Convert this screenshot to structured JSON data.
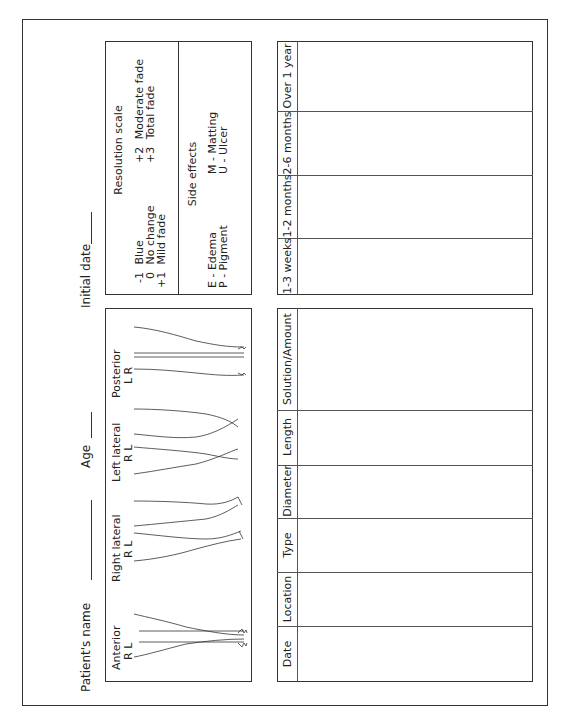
{
  "header": {
    "patient_name_label": "Patient's name",
    "age_label": "Age",
    "initial_date_label": "Initial date"
  },
  "resolution_scale": {
    "title": "Resolution scale",
    "items": [
      {
        "code": "-1",
        "label": "Blue"
      },
      {
        "code": "0",
        "label": "No change"
      },
      {
        "code": "+1",
        "label": "Mild fade"
      },
      {
        "code": "+2",
        "label": "Moderate fade"
      },
      {
        "code": "+3",
        "label": "Total fade"
      }
    ]
  },
  "side_effects": {
    "title": "Side effects",
    "items": [
      {
        "code": "E",
        "label": "Edema"
      },
      {
        "code": "P",
        "label": "Pigment"
      },
      {
        "code": "M",
        "label": "Matting"
      },
      {
        "code": "U",
        "label": "Ulcer"
      }
    ]
  },
  "leg_views": [
    {
      "label": "Anterior",
      "sides": "R   L"
    },
    {
      "label": "Right lateral",
      "sides": "R   L"
    },
    {
      "label": "Left lateral",
      "sides": "R   L"
    },
    {
      "label": "Posterior",
      "sides": "L   R"
    }
  ],
  "followup_table": {
    "columns": [
      "1-3 weeks",
      "1-2 months",
      "2-6 months",
      "Over 1 year"
    ]
  },
  "treatment_table": {
    "columns": [
      "Date",
      "Location",
      "Type",
      "Diameter",
      "Length",
      "Solution/Amount"
    ]
  }
}
